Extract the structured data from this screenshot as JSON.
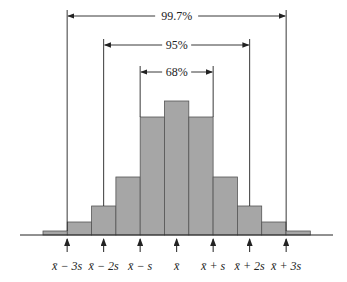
{
  "chart_data": {
    "type": "bar",
    "title": "",
    "xlabel": "",
    "ylabel": "",
    "grid": false,
    "categories": [
      "b1",
      "b2",
      "b3",
      "b4",
      "b5",
      "b6",
      "b7",
      "b8",
      "b9",
      "b10",
      "b11"
    ],
    "values": [
      4,
      13,
      29,
      58,
      118,
      134,
      118,
      58,
      29,
      13,
      4
    ],
    "bar_color": "#a6a6a6",
    "tick_labels": [
      "x̄ − 3s",
      "x̄ − 2s",
      "x̄ − s",
      "x̄",
      "x̄ + s",
      "x̄ + 2s",
      "x̄ + 3s"
    ],
    "intervals": [
      {
        "label": "68%",
        "from": "x̄ − s",
        "to": "x̄ + s"
      },
      {
        "label": "95%",
        "from": "x̄ − 2s",
        "to": "x̄ + 2s"
      },
      {
        "label": "99.7%",
        "from": "x̄ − 3s",
        "to": "x̄ + 3s"
      }
    ]
  },
  "labels": {
    "i68": "68%",
    "i95": "95%",
    "i997": "99.7%"
  }
}
